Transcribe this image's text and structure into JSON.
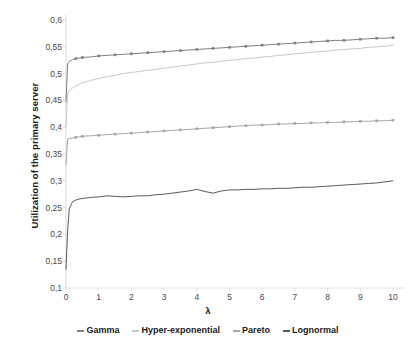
{
  "chart_data": {
    "type": "line",
    "title": "",
    "xlabel": "λ",
    "ylabel": "Utilization of the primary server",
    "xlim": [
      0,
      10
    ],
    "ylim": [
      0.1,
      0.6
    ],
    "grid": false,
    "legend_position": "bottom",
    "x_ticks": [
      "0",
      "1",
      "2",
      "3",
      "4",
      "5",
      "6",
      "7",
      "8",
      "9",
      "10"
    ],
    "y_ticks": [
      "0,1",
      "0,15",
      "0,2",
      "0,25",
      "0,3",
      "0,35",
      "0,4",
      "0,45",
      "0,5",
      "0,55",
      "0,6"
    ],
    "x": [
      0,
      0.05,
      0.1,
      0.2,
      0.3,
      0.4,
      0.5,
      0.75,
      1.0,
      1.25,
      1.5,
      1.75,
      2.0,
      2.25,
      2.5,
      2.75,
      3.0,
      3.25,
      3.5,
      3.75,
      4.0,
      4.25,
      4.5,
      4.75,
      5.0,
      5.25,
      5.5,
      5.75,
      6.0,
      6.25,
      6.5,
      6.75,
      7.0,
      7.25,
      7.5,
      7.75,
      8.0,
      8.25,
      8.5,
      8.75,
      9.0,
      9.25,
      9.5,
      9.75,
      10.0
    ],
    "series": [
      {
        "name": "Gamma",
        "color": "#808080",
        "markers": true,
        "values": [
          0.447,
          0.518,
          0.523,
          0.526,
          0.528,
          0.529,
          0.53,
          0.531,
          0.533,
          0.534,
          0.535,
          0.536,
          0.537,
          0.538,
          0.539,
          0.54,
          0.541,
          0.542,
          0.543,
          0.544,
          0.545,
          0.546,
          0.547,
          0.548,
          0.549,
          0.55,
          0.551,
          0.552,
          0.553,
          0.554,
          0.555,
          0.556,
          0.557,
          0.558,
          0.559,
          0.56,
          0.561,
          0.562,
          0.562,
          0.563,
          0.564,
          0.565,
          0.566,
          0.566,
          0.567
        ]
      },
      {
        "name": "Hyper-exponential",
        "color": "#c8c8c8",
        "markers": false,
        "values": [
          0.4,
          0.462,
          0.468,
          0.473,
          0.477,
          0.48,
          0.483,
          0.487,
          0.491,
          0.494,
          0.497,
          0.5,
          0.502,
          0.504,
          0.506,
          0.508,
          0.51,
          0.512,
          0.514,
          0.516,
          0.518,
          0.52,
          0.521,
          0.523,
          0.525,
          0.526,
          0.528,
          0.529,
          0.531,
          0.532,
          0.534,
          0.535,
          0.537,
          0.538,
          0.54,
          0.541,
          0.542,
          0.544,
          0.545,
          0.546,
          0.547,
          0.549,
          0.55,
          0.551,
          0.553
        ]
      },
      {
        "name": "Pareto",
        "color": "#a6a6a6",
        "markers": true,
        "values": [
          0.33,
          0.378,
          0.379,
          0.38,
          0.381,
          0.382,
          0.383,
          0.384,
          0.385,
          0.386,
          0.387,
          0.388,
          0.389,
          0.39,
          0.391,
          0.392,
          0.393,
          0.394,
          0.395,
          0.396,
          0.397,
          0.398,
          0.399,
          0.4,
          0.401,
          0.402,
          0.403,
          0.404,
          0.404,
          0.405,
          0.406,
          0.406,
          0.407,
          0.407,
          0.408,
          0.408,
          0.409,
          0.409,
          0.41,
          0.41,
          0.411,
          0.411,
          0.412,
          0.412,
          0.413
        ]
      },
      {
        "name": "Lognormal",
        "color": "#5a5a5a",
        "markers": false,
        "values": [
          0.135,
          0.206,
          0.248,
          0.261,
          0.264,
          0.266,
          0.267,
          0.269,
          0.27,
          0.272,
          0.271,
          0.27,
          0.271,
          0.272,
          0.272,
          0.274,
          0.275,
          0.277,
          0.279,
          0.281,
          0.284,
          0.28,
          0.277,
          0.281,
          0.283,
          0.283,
          0.284,
          0.284,
          0.285,
          0.285,
          0.286,
          0.286,
          0.287,
          0.288,
          0.288,
          0.289,
          0.29,
          0.291,
          0.292,
          0.293,
          0.294,
          0.295,
          0.296,
          0.298,
          0.3
        ]
      }
    ]
  },
  "legend": {
    "items": [
      {
        "label": "Gamma"
      },
      {
        "label": "Hyper-exponential"
      },
      {
        "label": "Pareto"
      },
      {
        "label": "Lognormal"
      }
    ]
  }
}
